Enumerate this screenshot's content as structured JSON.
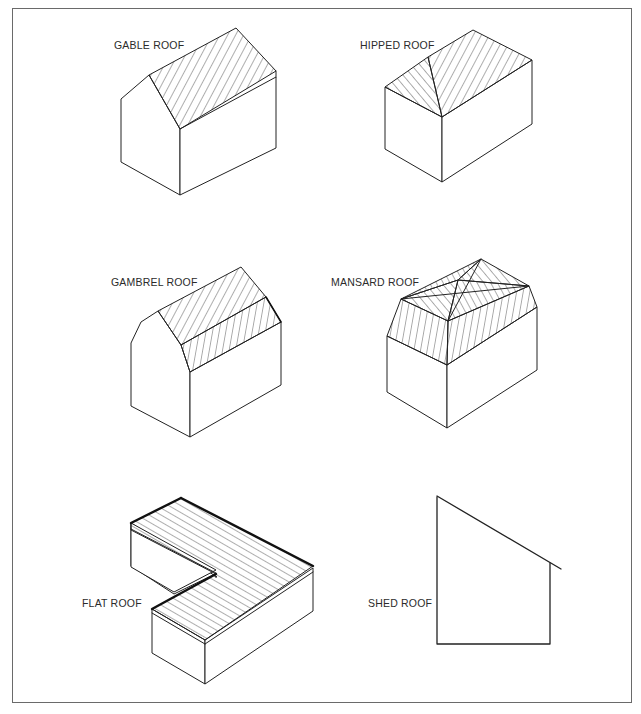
{
  "figure": {
    "panels": [
      {
        "id": "gable",
        "label": "GABLE ROOF",
        "position": "top-left"
      },
      {
        "id": "hipped",
        "label": "HIPPED ROOF",
        "position": "top-right"
      },
      {
        "id": "gambrel",
        "label": "GAMBREL ROOF",
        "position": "middle-left"
      },
      {
        "id": "mansard",
        "label": "MANSARD ROOF",
        "position": "middle-right"
      },
      {
        "id": "flat",
        "label": "FLAT ROOF",
        "position": "bottom-left"
      },
      {
        "id": "shed",
        "label": "SHED ROOF",
        "position": "bottom-right"
      }
    ]
  },
  "colors": {
    "line": "#222222",
    "text": "#2b2b2b",
    "frame": "#6a6a6a",
    "background": "#ffffff"
  }
}
